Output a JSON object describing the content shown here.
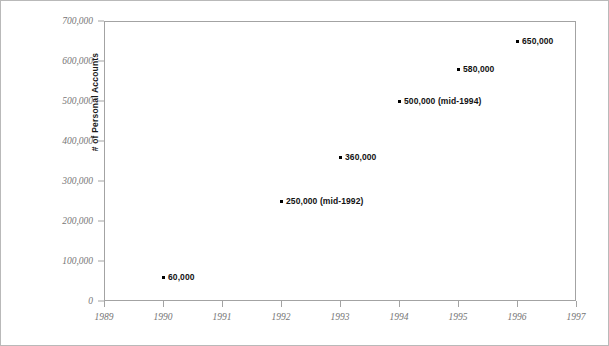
{
  "chart_data": {
    "type": "scatter",
    "title": "",
    "subtitle": "",
    "xlabel": "",
    "ylabel": "# of Personal Accounts",
    "xlim": [
      1989,
      1997
    ],
    "ylim": [
      0,
      700000
    ],
    "grid": false,
    "legend": null,
    "x_ticks": [
      "1989",
      "1990",
      "1991",
      "1992",
      "1993",
      "1994",
      "1995",
      "1996",
      "1997"
    ],
    "x_tick_values": [
      1989,
      1990,
      1991,
      1992,
      1993,
      1994,
      1995,
      1996,
      1997
    ],
    "y_ticks": [
      "0",
      "100,000",
      "200,000",
      "300,000",
      "400,000",
      "500,000",
      "600,000",
      "700,000"
    ],
    "y_tick_values": [
      0,
      100000,
      200000,
      300000,
      400000,
      500000,
      600000,
      700000
    ],
    "x": [
      1990,
      1992,
      1993,
      1994,
      1995,
      1996
    ],
    "values": [
      60000,
      250000,
      360000,
      500000,
      580000,
      650000
    ],
    "point_labels": [
      "60,000",
      "250,000 (mid-1992)",
      "360,000",
      "500,000 (mid-1994)",
      "580,000",
      "650,000"
    ],
    "marker_color": "#000000",
    "axis_color": "#a3a3a3",
    "tick_label_color": "#767676",
    "label_color": "#111111",
    "frame_color": "#b9b9b9",
    "background": "#ffffff"
  }
}
